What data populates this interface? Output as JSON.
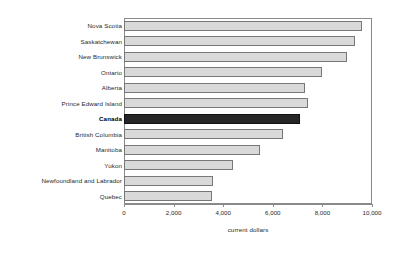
{
  "chart_data": {
    "type": "bar",
    "orientation": "horizontal",
    "title": "",
    "xlabel": "current dollars",
    "ylabel": "",
    "xlim": [
      0,
      10000
    ],
    "xticks": [
      0,
      2000,
      4000,
      6000,
      8000,
      10000
    ],
    "xtick_labels": [
      "0",
      "2,000",
      "4,000",
      "6,000",
      "8,000",
      "10,000"
    ],
    "grid": false,
    "legend": false,
    "categories": [
      "Nova Scotia",
      "Saskatchewan",
      "New Brunswick",
      "Ontario",
      "Alberta",
      "Prince Edward Island",
      "Canada",
      "British Columbia",
      "Manitoba",
      "Yukon",
      "Newfoundland and Labrador",
      "Quebec"
    ],
    "values": [
      9600,
      9300,
      9000,
      8000,
      7300,
      7400,
      7100,
      6400,
      5500,
      4400,
      3600,
      3550
    ],
    "highlight_category": "Canada",
    "colors": {
      "bar_fill": "#d9d9d9",
      "bar_edge": "#777777",
      "highlight_fill": "#262626",
      "highlight_edge": "#111111",
      "axis": "#8a8a8a",
      "text": "#1f1f1f",
      "background": "#ffffff"
    }
  }
}
